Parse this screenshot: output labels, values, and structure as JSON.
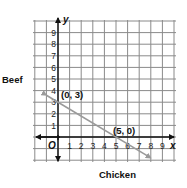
{
  "chart_data": {
    "type": "line",
    "title": "",
    "xlabel": "Chicken",
    "ylabel": "Beef",
    "x_axis_letter": "x",
    "y_axis_letter": "y",
    "origin_label": "O",
    "xlim": [
      -1.9,
      10.2
    ],
    "ylim": [
      -2,
      10
    ],
    "x_ticks": [
      "1",
      "2",
      "3",
      "4",
      "5",
      "6",
      "7",
      "8",
      "9"
    ],
    "y_ticks": [
      "1",
      "2",
      "3",
      "4",
      "5",
      "6",
      "7",
      "8",
      "9"
    ],
    "grid": true,
    "series": [
      {
        "name": "constraint line",
        "equation": "3x + 5y = 15",
        "x": [
          -1,
          8
        ],
        "y": [
          3.6,
          -1.8
        ],
        "color": "#9a9a9a"
      }
    ],
    "annotations": [
      {
        "text": "(0, 3)",
        "x": 0,
        "y": 3
      },
      {
        "text": "(5, 0)",
        "x": 5,
        "y": 0
      }
    ],
    "colors": {
      "grid": "#8a8a8a",
      "axis": "#111111",
      "line": "#9a9a9a"
    }
  }
}
